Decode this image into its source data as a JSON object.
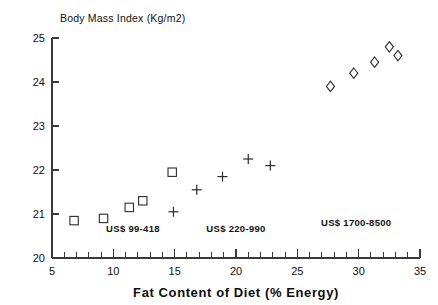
{
  "chart_data": {
    "type": "scatter",
    "title": "Body Mass Index (Kg/m2)",
    "xlabel": "Fat Content of Diet (% Energy)",
    "ylabel": "Body Mass Index (Kg/m2)",
    "xlim": [
      5,
      35
    ],
    "ylim": [
      20,
      25
    ],
    "grid": false,
    "legend_position": "inline-annotations",
    "x_ticks": [
      5,
      10,
      15,
      20,
      25,
      30,
      35
    ],
    "x_tick_labels": [
      "5",
      "10",
      "15",
      "20",
      "25",
      "30",
      "35"
    ],
    "x_minor_tick_step": 1,
    "y_ticks": [
      20,
      21,
      22,
      23,
      24,
      25
    ],
    "y_tick_labels": [
      "20",
      "21",
      "22",
      "23",
      "24",
      "25"
    ],
    "series": [
      {
        "name": "US$ 99-418",
        "marker": "open-square",
        "annotation": "US$ 99-418",
        "annotation_x": 11.6,
        "annotation_y": 20.58,
        "points": [
          {
            "x": 6.8,
            "y": 20.85
          },
          {
            "x": 9.2,
            "y": 20.9
          },
          {
            "x": 11.3,
            "y": 21.15
          },
          {
            "x": 12.4,
            "y": 21.3
          },
          {
            "x": 14.8,
            "y": 21.95
          }
        ]
      },
      {
        "name": "US$ 220-990",
        "marker": "plus",
        "annotation": "US$ 220-990",
        "annotation_x": 20.0,
        "annotation_y": 20.58,
        "points": [
          {
            "x": 14.9,
            "y": 21.05
          },
          {
            "x": 16.8,
            "y": 21.55
          },
          {
            "x": 18.9,
            "y": 21.85
          },
          {
            "x": 21.0,
            "y": 22.25
          },
          {
            "x": 22.8,
            "y": 22.1
          }
        ]
      },
      {
        "name": "US$ 1700-8500",
        "marker": "open-diamond",
        "annotation": "US$ 1700-8500",
        "annotation_x": 29.8,
        "annotation_y": 20.73,
        "points": [
          {
            "x": 27.7,
            "y": 23.9
          },
          {
            "x": 29.6,
            "y": 24.2
          },
          {
            "x": 31.3,
            "y": 24.45
          },
          {
            "x": 32.5,
            "y": 24.8
          },
          {
            "x": 33.2,
            "y": 24.6
          }
        ]
      }
    ]
  },
  "colors": {
    "axis": "#3a3a3a",
    "marker": "#2b2b2b",
    "text": "#111111",
    "background": "#ffffff"
  }
}
